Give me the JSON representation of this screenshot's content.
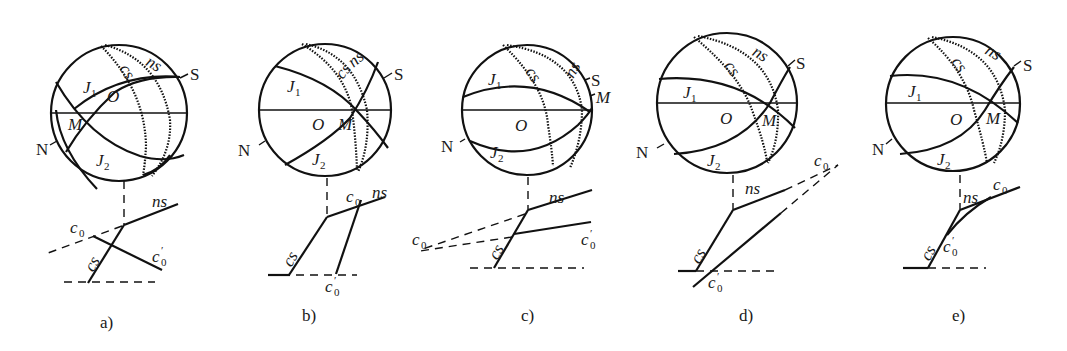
{
  "figure": {
    "panels": [
      {
        "id": "a",
        "caption": "a)",
        "labels": {
          "N": "N",
          "S": "S",
          "O": "O",
          "M": "M",
          "J1": "J",
          "J1_sub": "1",
          "J2": "J",
          "J2_sub": "2",
          "cs": "cs",
          "ns": "ns",
          "c0": "c",
          "c0_sub": "0",
          "c0p": "c",
          "c0p_sub": "0",
          "c0p_prime": "′",
          "cs_low": "cs",
          "ns_low": "ns"
        }
      },
      {
        "id": "b",
        "caption": "b)",
        "labels": {
          "N": "N",
          "S": "S",
          "O": "O",
          "M": "M",
          "J1": "J",
          "J1_sub": "1",
          "J2": "J",
          "J2_sub": "2",
          "cs": "cs",
          "ns": "ns",
          "c0": "c",
          "c0_sub": "0",
          "c0p": "c",
          "c0p_sub": "0",
          "c0p_prime": "′",
          "cs_low": "cs",
          "ns_low": "ns"
        }
      },
      {
        "id": "c",
        "caption": "c)",
        "labels": {
          "N": "N",
          "S": "S",
          "O": "O",
          "M": "M",
          "J1": "J",
          "J1_sub": "1",
          "J2": "J",
          "J2_sub": "2",
          "cs": "cs",
          "ns": "ns",
          "c0": "c",
          "c0_sub": "0",
          "c0p": "c",
          "c0p_sub": "0",
          "c0p_prime": "′",
          "cs_low": "cs",
          "ns_low": "ns"
        }
      },
      {
        "id": "d",
        "caption": "d)",
        "labels": {
          "N": "N",
          "S": "S",
          "O": "O",
          "M": "M",
          "J1": "J",
          "J1_sub": "1",
          "J2": "J",
          "J2_sub": "2",
          "cs": "cs",
          "ns": "ns",
          "c0": "c",
          "c0_sub": "0",
          "c0p": "c",
          "c0p_sub": "0",
          "c0p_prime": "′",
          "cs_low": "cs",
          "ns_low": "ns"
        }
      },
      {
        "id": "e",
        "caption": "e)",
        "labels": {
          "N": "N",
          "S": "S",
          "O": "O",
          "M": "M",
          "J1": "J",
          "J1_sub": "1",
          "J2": "J",
          "J2_sub": "2",
          "cs": "cs",
          "ns": "ns",
          "c0": "c",
          "c0_sub": "0",
          "c0p": "c",
          "c0p_sub": "0",
          "c0p_prime": "′",
          "cs_low": "cs",
          "ns_low": "ns"
        }
      }
    ],
    "colors": {
      "ink": "#111111",
      "background": "#ffffff"
    }
  }
}
